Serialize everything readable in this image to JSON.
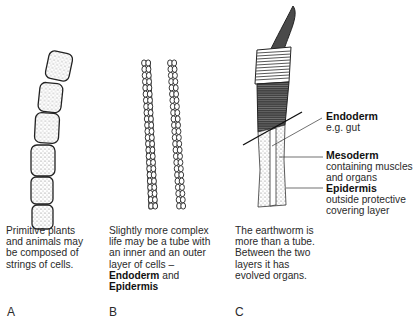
{
  "panels": [
    {
      "letter": "A",
      "caption_lines": [
        "Primitive plants",
        "and animals may",
        "be composed of",
        "strings of cells."
      ]
    },
    {
      "letter": "B",
      "caption_lines": [
        "Slightly more complex",
        "life may be a tube with",
        "an inner and an outer",
        "layer of cells –"
      ],
      "caption_bold_1": "Endoderm",
      "caption_and": " and",
      "caption_bold_2": "Epidermis"
    },
    {
      "letter": "C",
      "caption_lines": [
        "The earthworm is",
        "more than a tube.",
        "Between the two",
        "layers it has",
        "evolved organs."
      ],
      "labels": [
        {
          "title": "Endoderm",
          "desc_lines": [
            "e.g. gut"
          ]
        },
        {
          "title": "Mesoderm",
          "desc_lines": [
            "containing muscles",
            "and organs"
          ]
        },
        {
          "title": "Epidermis",
          "desc_lines": [
            "outside protective",
            "covering layer"
          ]
        }
      ]
    }
  ],
  "colors": {
    "ink": "#222222",
    "worm_dark": "#4a4a4a",
    "stipple": "#d8d8d8"
  }
}
